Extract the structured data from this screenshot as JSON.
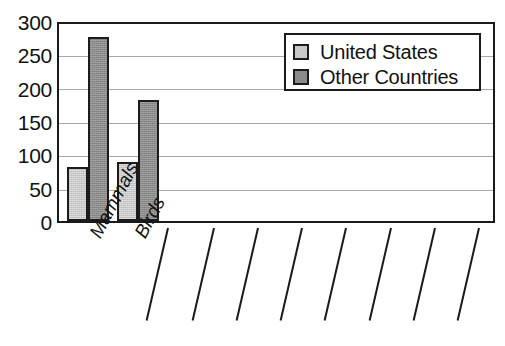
{
  "chart_data": {
    "type": "bar",
    "title": "",
    "subtitle": "",
    "xlabel": "",
    "ylabel": "",
    "categories": [
      "Mammals",
      "Birds"
    ],
    "series": [
      {
        "name": "United States",
        "values": [
          82,
          90
        ],
        "color": "#c9c9c9"
      },
      {
        "name": "Other Countries",
        "values": [
          280,
          185
        ],
        "color": "#8b8b8b"
      }
    ],
    "ylim": [
      0,
      300
    ],
    "yticks": [
      0,
      50,
      100,
      150,
      200,
      250,
      300
    ],
    "ytick_labels": [
      "0",
      "50",
      "100",
      "150",
      "200",
      "250",
      "300"
    ],
    "grid": "horizontal",
    "legend_position": "top-right",
    "legend_entries": [
      "United States",
      "Other Countries"
    ],
    "extra_tick_marks": 8
  },
  "colors": {
    "axis": "#1a1a1a",
    "grid": "#a9a9a9",
    "background": "#ffffff",
    "bar_light": "#c9c9c9",
    "bar_dark": "#8b8b8b"
  }
}
